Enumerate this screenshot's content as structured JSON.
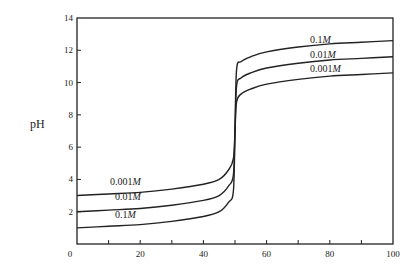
{
  "chart_data": {
    "type": "line",
    "title": "",
    "xlabel": "",
    "ylabel": "pH",
    "xlim": [
      0,
      100
    ],
    "ylim": [
      0,
      14
    ],
    "x_ticks": [
      0,
      20,
      40,
      60,
      80,
      100
    ],
    "x_minor_ticks": [
      10,
      30,
      50,
      70,
      90
    ],
    "y_ticks": [
      2,
      4,
      6,
      8,
      10,
      12,
      14
    ],
    "y_tick_labels": [
      "0",
      "2",
      "4",
      "6",
      "8",
      "10",
      "12",
      "14"
    ],
    "grid": false,
    "legend": "inline labels on curves",
    "equivalence_x": 50,
    "series": [
      {
        "name": "0.1M",
        "label_num": "0.1",
        "label_unit": "M",
        "x": [
          0,
          10,
          20,
          30,
          40,
          45,
          48,
          49.5,
          50,
          50.5,
          52,
          55,
          60,
          70,
          80,
          90,
          100
        ],
        "y": [
          1.0,
          1.1,
          1.2,
          1.4,
          1.7,
          2.0,
          2.6,
          3.3,
          7.0,
          10.8,
          11.3,
          11.6,
          11.9,
          12.2,
          12.4,
          12.5,
          12.6
        ]
      },
      {
        "name": "0.01M",
        "label_num": "0.01",
        "label_unit": "M",
        "x": [
          0,
          10,
          20,
          30,
          40,
          45,
          48,
          49.5,
          50,
          50.5,
          52,
          55,
          60,
          70,
          80,
          90,
          100
        ],
        "y": [
          2.0,
          2.1,
          2.2,
          2.4,
          2.7,
          3.0,
          3.6,
          4.3,
          7.0,
          9.8,
          10.3,
          10.6,
          10.9,
          11.2,
          11.4,
          11.5,
          11.6
        ]
      },
      {
        "name": "0.001M",
        "label_num": "0.001",
        "label_unit": "M",
        "x": [
          0,
          10,
          20,
          30,
          40,
          45,
          48,
          49.5,
          50,
          50.5,
          52,
          55,
          60,
          70,
          80,
          90,
          100
        ],
        "y": [
          3.0,
          3.1,
          3.2,
          3.4,
          3.7,
          4.0,
          4.6,
          5.3,
          7.0,
          8.8,
          9.3,
          9.6,
          9.9,
          10.2,
          10.4,
          10.5,
          10.6
        ]
      }
    ]
  }
}
